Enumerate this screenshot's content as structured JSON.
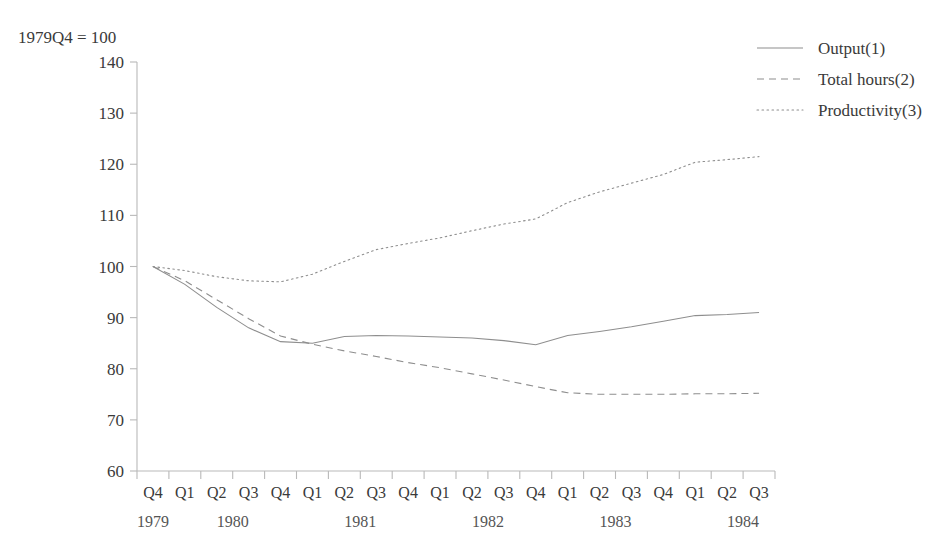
{
  "annotation": {
    "index_note": "1979Q4 = 100",
    "clipped_title": "·                    ·"
  },
  "legend": {
    "position": "top-right",
    "items": [
      {
        "label": "Output(1)",
        "dash": "none"
      },
      {
        "label": "Total hours(2)",
        "dash": "dashed"
      },
      {
        "label": "Productivity(3)",
        "dash": "dotted"
      }
    ]
  },
  "axes": {
    "y": {
      "min": 60,
      "max": 140,
      "step": 10,
      "ticks": [
        "60",
        "70",
        "80",
        "90",
        "100",
        "110",
        "120",
        "130",
        "140"
      ]
    },
    "x": {
      "quarter_labels": [
        "Q4",
        "Q1",
        "Q2",
        "Q3",
        "Q4",
        "Q1",
        "Q2",
        "Q3",
        "Q4",
        "Q1",
        "Q2",
        "Q3",
        "Q4",
        "Q1",
        "Q2",
        "Q3",
        "Q4",
        "Q1",
        "Q2",
        "Q3"
      ],
      "year_labels": [
        "1979",
        "1980",
        "1981",
        "1982",
        "1983",
        "1984"
      ]
    }
  },
  "colors": {
    "background": "#ffffff",
    "line": "#8e8e8e",
    "axis": "#b9b9b9",
    "text": "#3a3a3a"
  },
  "chart_data": {
    "type": "line",
    "title": "",
    "subtitle": "",
    "xlabel": "",
    "ylabel": "",
    "ylim": [
      60,
      140
    ],
    "grid": false,
    "legend_position": "top-right",
    "annotations": [
      "1979Q4 = 100"
    ],
    "categories": [
      "1979Q4",
      "1980Q1",
      "1980Q2",
      "1980Q3",
      "1980Q4",
      "1981Q1",
      "1981Q2",
      "1981Q3",
      "1981Q4",
      "1982Q1",
      "1982Q2",
      "1982Q3",
      "1982Q4",
      "1983Q1",
      "1983Q2",
      "1983Q3",
      "1983Q4",
      "1984Q1",
      "1984Q2",
      "1984Q3"
    ],
    "series": [
      {
        "name": "Output(1)",
        "dash": "none",
        "values": [
          100.0,
          96.5,
          92.0,
          88.0,
          85.3,
          85.0,
          86.3,
          86.5,
          86.4,
          86.2,
          86.0,
          85.5,
          84.7,
          86.5,
          87.3,
          88.2,
          89.3,
          90.4,
          90.6,
          91.0
        ]
      },
      {
        "name": "Total hours(2)",
        "dash": "dashed",
        "values": [
          100.0,
          97.2,
          93.5,
          89.8,
          86.4,
          84.8,
          83.5,
          82.4,
          81.2,
          80.2,
          79.0,
          77.8,
          76.5,
          75.3,
          75.0,
          75.0,
          75.0,
          75.1,
          75.1,
          75.2
        ]
      },
      {
        "name": "Productivity(3)",
        "dash": "dotted",
        "values": [
          100.0,
          99.2,
          98.0,
          97.2,
          97.0,
          98.5,
          101.0,
          103.3,
          104.5,
          105.6,
          107.0,
          108.3,
          109.3,
          112.5,
          114.6,
          116.3,
          118.0,
          120.4,
          120.9,
          121.5
        ]
      }
    ]
  }
}
